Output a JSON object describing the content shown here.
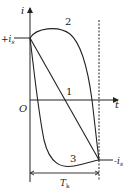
{
  "diagram": {
    "axis_y_label": "i",
    "axis_x_label": "t",
    "origin_label": "O",
    "pos_level_label": "+i",
    "pos_level_sub": "s",
    "neg_level_label": "-i",
    "neg_level_sub": "s",
    "period_label": "T",
    "period_sub": "k",
    "curve_labels": [
      "1",
      "2",
      "3"
    ],
    "stroke_color": "#222222"
  }
}
